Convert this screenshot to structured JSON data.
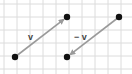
{
  "diagram": {
    "title": "",
    "grid": {
      "spacing": 13,
      "offset_x": 4,
      "offset_y": 4,
      "color": "#dcdcdc",
      "background": "#ffffff"
    },
    "points": [
      {
        "id": "p1",
        "x": 15,
        "y": 57
      },
      {
        "id": "p2",
        "x": 67,
        "y": 17
      },
      {
        "id": "p3",
        "x": 67,
        "y": 57
      },
      {
        "id": "p4",
        "x": 119,
        "y": 17
      }
    ],
    "vectors": [
      {
        "id": "v",
        "label": "v",
        "from": "p1",
        "to": "p2",
        "label_x": 24,
        "label_y": 37
      },
      {
        "id": "neg-v",
        "label": "− v",
        "from": "p4",
        "to": "p3",
        "label_x": 74,
        "label_y": 37
      }
    ],
    "colors": {
      "point": "#111111",
      "arrow": "#9a9a9a",
      "label": "#444444"
    }
  }
}
